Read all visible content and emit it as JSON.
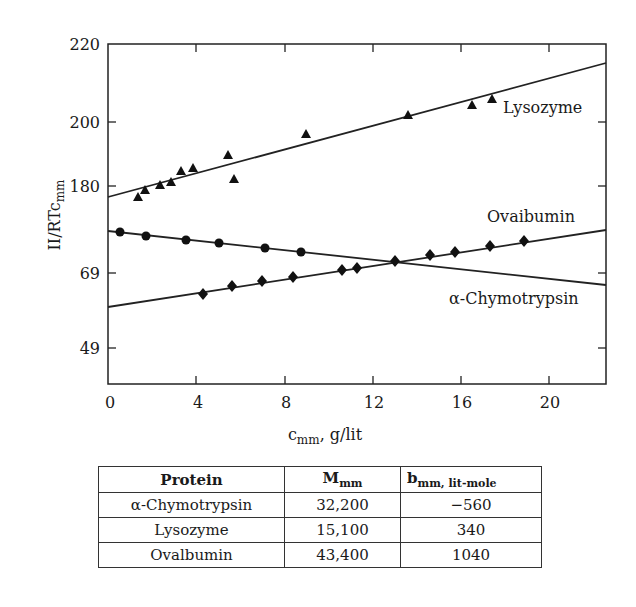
{
  "chart_data": {
    "type": "scatter",
    "title": "",
    "xlabel": "c_mm, g/lit",
    "xlabel_main": "c",
    "xlabel_sub": "mm",
    "xlabel_tail": ", g/lit",
    "ylabel": "II/RTc_mm",
    "ylabel_main": "II/RTc",
    "ylabel_sub": "mm",
    "xlim": [
      0,
      22.6
    ],
    "x_ticks": [
      "0",
      "4",
      "8",
      "12",
      "16",
      "20"
    ],
    "y_ticks": [
      "220",
      "200",
      "180",
      "69",
      "49"
    ],
    "y_axis_note": "broken/non-linear y-axis as printed (220, 200, 180, 69, 49)",
    "grid": false,
    "legend_position": "inline labels next to lines",
    "series": [
      {
        "name": "Lysozyme",
        "marker": "triangle",
        "points": [
          {
            "x": 1.4,
            "y": 177
          },
          {
            "x": 1.7,
            "y": 179
          },
          {
            "x": 2.4,
            "y": 180
          },
          {
            "x": 2.9,
            "y": 181
          },
          {
            "x": 3.3,
            "y": 184
          },
          {
            "x": 3.9,
            "y": 185
          },
          {
            "x": 5.4,
            "y": 189
          },
          {
            "x": 5.7,
            "y": 182
          },
          {
            "x": 9.0,
            "y": 196
          },
          {
            "x": 13.6,
            "y": 202
          },
          {
            "x": 16.5,
            "y": 205
          },
          {
            "x": 17.4,
            "y": 207
          }
        ],
        "fit_line": {
          "x": [
            0,
            22.6
          ],
          "y": [
            177,
            216
          ]
        }
      },
      {
        "name": "Ovaibumin",
        "marker": "circle",
        "points": [
          {
            "x": 0.5,
            "y": 120
          },
          {
            "x": 1.7,
            "y": 118
          },
          {
            "x": 3.5,
            "y": 116
          },
          {
            "x": 5.0,
            "y": 114
          },
          {
            "x": 7.1,
            "y": 111
          },
          {
            "x": 8.8,
            "y": 109
          }
        ],
        "fit_line": {
          "x": [
            0,
            22.6
          ],
          "y": [
            121,
            63
          ]
        }
      },
      {
        "name": "α-Chymotrypsin",
        "marker": "diamond",
        "points": [
          {
            "x": 4.3,
            "y": 63
          },
          {
            "x": 5.6,
            "y": 64
          },
          {
            "x": 7.0,
            "y": 65
          },
          {
            "x": 8.4,
            "y": 66
          },
          {
            "x": 10.6,
            "y": 68
          },
          {
            "x": 11.3,
            "y": 69
          },
          {
            "x": 13.0,
            "y": 70
          },
          {
            "x": 14.6,
            "y": 72
          },
          {
            "x": 15.7,
            "y": 73
          },
          {
            "x": 17.3,
            "y": 75
          },
          {
            "x": 18.9,
            "y": 77
          }
        ],
        "fit_line": {
          "x": [
            0,
            22.6
          ],
          "y": [
            58,
            81
          ]
        }
      }
    ],
    "pixel_geometry": {
      "lysozyme_pts": [
        [
          138,
          197
        ],
        [
          145,
          190
        ],
        [
          160,
          185
        ],
        [
          171,
          182
        ],
        [
          181,
          171
        ],
        [
          193,
          168
        ],
        [
          228,
          155
        ],
        [
          234,
          179
        ],
        [
          306,
          134
        ],
        [
          408,
          115
        ],
        [
          472,
          105
        ],
        [
          492,
          99
        ]
      ],
      "lysozyme_line": [
        [
          108,
          197
        ],
        [
          606,
          63
        ]
      ],
      "ovalbumin_pts": [
        [
          120,
          232
        ],
        [
          146,
          236
        ],
        [
          186,
          240
        ],
        [
          219,
          243
        ],
        [
          265,
          248
        ],
        [
          301,
          252
        ]
      ],
      "ovalbumin_line": [
        [
          108,
          231
        ],
        [
          606,
          285
        ]
      ],
      "chymo_pts": [
        [
          203,
          294
        ],
        [
          232,
          286
        ],
        [
          262,
          281
        ],
        [
          293,
          277
        ],
        [
          342,
          270
        ],
        [
          357,
          268
        ],
        [
          395,
          261
        ],
        [
          430,
          255
        ],
        [
          455,
          252
        ],
        [
          490,
          246
        ],
        [
          524,
          241
        ]
      ],
      "chymo_line": [
        [
          108,
          307
        ],
        [
          606,
          230
        ]
      ]
    }
  },
  "labels": {
    "lysozyme": "Lysozyme",
    "ovalbumin": "Ovaibumin",
    "chymotrypsin": "α-Chymotrypsin"
  },
  "table": {
    "headers": {
      "protein": "Protein",
      "m_main": "M",
      "m_sub": "mm",
      "b_main": "b",
      "b_sub": "mm, lit-mole"
    },
    "rows": [
      {
        "protein": "α-Chymotrypsin",
        "m": "32,200",
        "b": "−560"
      },
      {
        "protein": "Lysozyme",
        "m": "15,100",
        "b": "340"
      },
      {
        "protein": "Ovalbumin",
        "m": "43,400",
        "b": "1040"
      }
    ]
  }
}
